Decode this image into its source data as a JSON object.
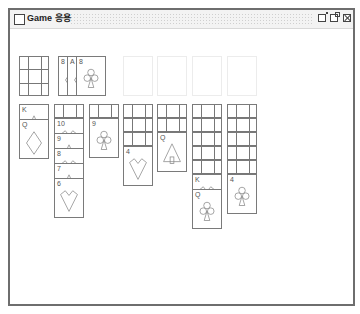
{
  "window": {
    "title": "Game 응용",
    "buttons": [
      "minimize",
      "maximize",
      "close"
    ]
  },
  "board": {
    "stock": {
      "face_down": true
    },
    "waste": [
      {
        "rank": "8",
        "suit": "diamonds"
      },
      {
        "rank": "A",
        "suit": "diamonds"
      },
      {
        "rank": "8",
        "suit": "clubs"
      }
    ],
    "foundations": [
      {
        "empty": true
      },
      {
        "empty": true
      },
      {
        "empty": true
      },
      {
        "empty": true
      }
    ],
    "tableau": [
      {
        "face_down": 0,
        "cards": [
          {
            "rank": "K",
            "suit": "spades"
          },
          {
            "rank": "Q",
            "suit": "diamonds"
          }
        ]
      },
      {
        "face_down": 1,
        "cards": [
          {
            "rank": "10",
            "suit": "hearts"
          },
          {
            "rank": "9",
            "suit": "spades"
          },
          {
            "rank": "8",
            "suit": "hearts"
          },
          {
            "rank": "7",
            "suit": "spades"
          },
          {
            "rank": "6",
            "suit": "hearts"
          }
        ]
      },
      {
        "face_down": 1,
        "cards": [
          {
            "rank": "9",
            "suit": "clubs"
          }
        ]
      },
      {
        "face_down": 3,
        "cards": [
          {
            "rank": "4",
            "suit": "hearts"
          }
        ]
      },
      {
        "face_down": 2,
        "cards": [
          {
            "rank": "Q",
            "suit": "spades"
          }
        ]
      },
      {
        "face_down": 5,
        "cards": [
          {
            "rank": "K",
            "suit": "hearts"
          },
          {
            "rank": "Q",
            "suit": "clubs"
          }
        ]
      },
      {
        "face_down": 5,
        "cards": [
          {
            "rank": "4",
            "suit": "clubs"
          }
        ]
      }
    ]
  }
}
